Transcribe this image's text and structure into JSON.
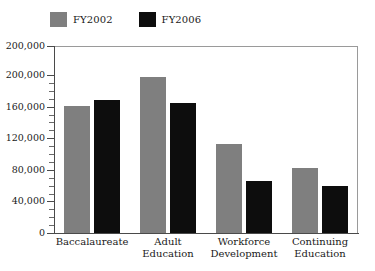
{
  "chart_data": {
    "type": "bar",
    "title": "",
    "subtitle": "",
    "xlabel": "",
    "ylabel": "",
    "grid": false,
    "legend_position": "top-left",
    "categories": [
      "Baccalaureate",
      "Adult Education",
      "Workforce Development",
      "Continuing Education"
    ],
    "category_lines": [
      [
        "Baccalaureate"
      ],
      [
        "Adult",
        "Education"
      ],
      [
        "Workforce",
        "Development"
      ],
      [
        "Continuing",
        "Education"
      ]
    ],
    "series": [
      {
        "name": "FY2002",
        "color": "#7f7f7f",
        "values": [
          161000,
          197000,
          113000,
          82000
        ]
      },
      {
        "name": "FY2006",
        "color": "#0d0d0d",
        "values": [
          168000,
          165000,
          66000,
          60000
        ]
      }
    ],
    "ylim": [
      0,
      200000
    ],
    "ytick_values": [
      0,
      40000,
      80000,
      120000,
      160000,
      200000,
      200000
    ],
    "ytick_labels": [
      "0",
      "40,000",
      "80,000",
      "120,000",
      "160,000",
      "200,000",
      "200,000"
    ],
    "ytick_minor_step": 10000,
    "axis_color": "#4a4a4a",
    "frame_color": "#9a9a9a",
    "background": "#ffffff"
  },
  "legend": {
    "entries": [
      {
        "label": "FY2002",
        "color": "#7f7f7f"
      },
      {
        "label": "FY2006",
        "color": "#0d0d0d"
      }
    ]
  }
}
